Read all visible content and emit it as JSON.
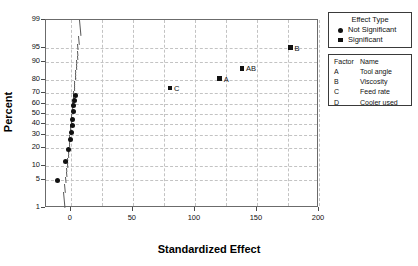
{
  "chart_data": {
    "type": "scatter",
    "title": "",
    "xlabel": "Standardized Effect",
    "ylabel": "Percent",
    "xlim": [
      -20,
      200
    ],
    "ylim_percent": [
      1,
      99
    ],
    "grid": true,
    "y_scale": "normal probability",
    "xticks": [
      0,
      50,
      100,
      150,
      200
    ],
    "yticks": [
      1,
      5,
      10,
      20,
      30,
      40,
      50,
      60,
      70,
      80,
      90,
      95,
      99
    ],
    "legend_position": "right",
    "reference_line": {
      "label": "normal fit line",
      "x_at_center": 0
    },
    "series": [
      {
        "name": "Not Significant",
        "marker": "circle",
        "points": [
          {
            "x": -11.0,
            "percent": 5,
            "label": ""
          },
          {
            "x": -4.5,
            "percent": 12,
            "label": ""
          },
          {
            "x": -1.5,
            "percent": 19,
            "label": ""
          },
          {
            "x": -0.5,
            "percent": 26,
            "label": ""
          },
          {
            "x": 0.5,
            "percent": 32,
            "label": ""
          },
          {
            "x": 1.0,
            "percent": 39,
            "label": ""
          },
          {
            "x": 1.5,
            "percent": 45,
            "label": ""
          },
          {
            "x": 2.0,
            "percent": 52,
            "label": ""
          },
          {
            "x": 2.5,
            "percent": 58,
            "label": ""
          },
          {
            "x": 3.0,
            "percent": 63,
            "label": ""
          },
          {
            "x": 4.0,
            "percent": 68,
            "label": ""
          }
        ]
      },
      {
        "name": "Significant",
        "marker": "square",
        "points": [
          {
            "x": 80.0,
            "percent": 74,
            "label": "C"
          },
          {
            "x": 120.0,
            "percent": 81,
            "label": "A"
          },
          {
            "x": 138.0,
            "percent": 87,
            "label": "AB"
          },
          {
            "x": 177.0,
            "percent": 95,
            "label": "B"
          }
        ]
      }
    ]
  },
  "axes": {
    "y_title": "Percent",
    "x_title": "Standardized Effect",
    "y_tick_labels": [
      "99",
      "95",
      "90",
      "80",
      "70",
      "60",
      "50",
      "40",
      "30",
      "20",
      "10",
      "5",
      "1"
    ],
    "x_tick_labels": [
      "0",
      "50",
      "100",
      "150",
      "200"
    ]
  },
  "legend_effect_type": {
    "title": "Effect Type",
    "entries": [
      {
        "marker": "circle-marker-icon",
        "label": "Not Significant"
      },
      {
        "marker": "square-marker-icon",
        "label": "Significant"
      }
    ]
  },
  "legend_factors": {
    "header": {
      "code": "Factor",
      "name": "Name"
    },
    "rows": [
      {
        "code": "A",
        "name": "Tool angle"
      },
      {
        "code": "B",
        "name": "Viscosity"
      },
      {
        "code": "C",
        "name": "Feed rate"
      },
      {
        "code": "D",
        "name": "Cooler used"
      }
    ]
  },
  "colors": {
    "marker": "#111111",
    "grid": "#c3c3c3",
    "frame": "#6b6b6b",
    "fit_line": "#5a5a5a",
    "background": "#ffffff"
  }
}
